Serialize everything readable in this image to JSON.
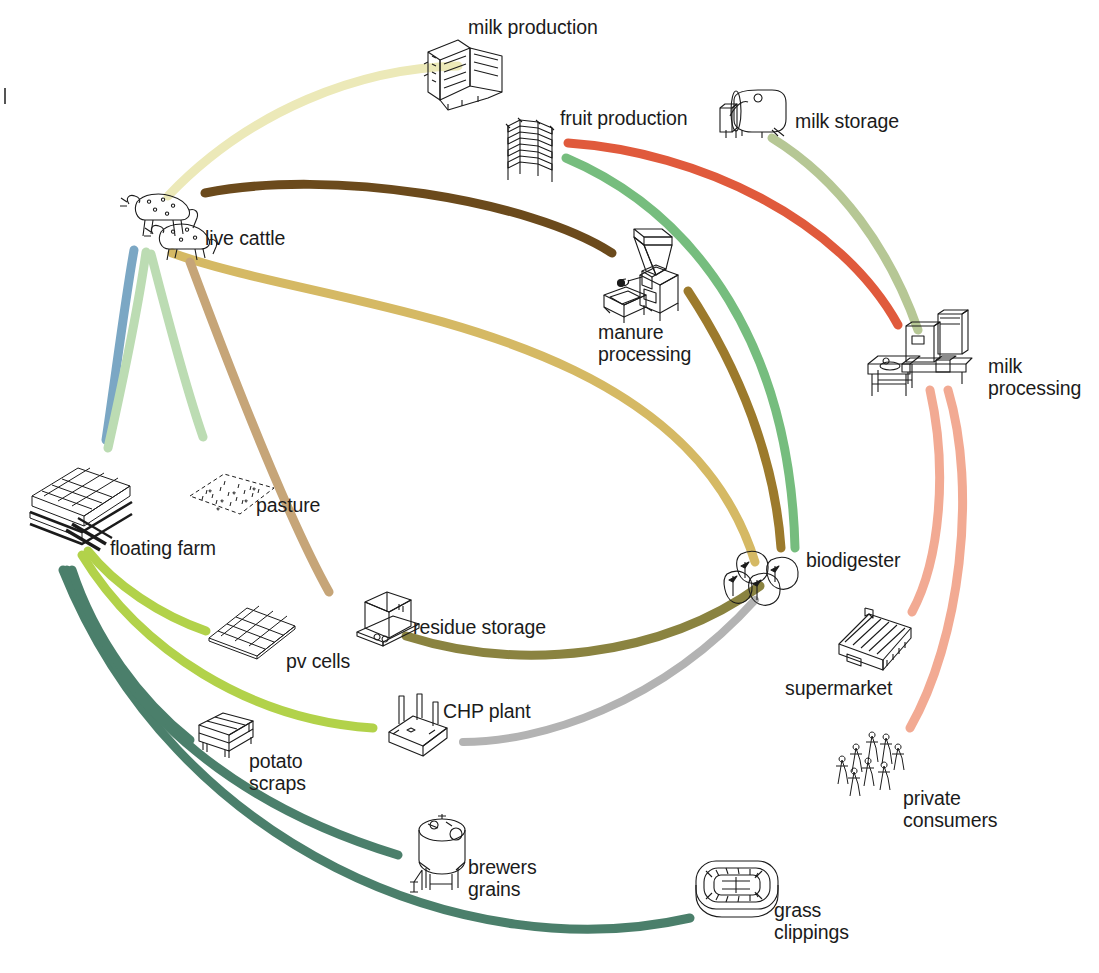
{
  "diagram": {
    "background": "#ffffff"
  },
  "nodes": [
    {
      "id": "milk-production",
      "label": "milk production",
      "label_x": 468,
      "label_y": 16,
      "icon_x": 418,
      "icon_y": 34,
      "icon": "milking-machine-icon"
    },
    {
      "id": "fruit-production",
      "label": "fruit production",
      "label_x": 560,
      "label_y": 107,
      "icon_x": 500,
      "icon_y": 112,
      "icon": "greenhouse-rack-icon"
    },
    {
      "id": "milk-storage",
      "label": "milk storage",
      "label_x": 795,
      "label_y": 110,
      "icon_x": 712,
      "icon_y": 86,
      "icon": "milk-tank-icon"
    },
    {
      "id": "milk-processing",
      "label": "milk\nprocessing",
      "label_x": 988,
      "label_y": 355,
      "icon_x": 866,
      "icon_y": 310,
      "icon": "processing-plant-icon"
    },
    {
      "id": "biodigester",
      "label": "biodigester",
      "label_x": 806,
      "label_y": 549,
      "icon_x": 723,
      "icon_y": 548,
      "icon": "biodigester-tanks-icon"
    },
    {
      "id": "supermarket",
      "label": "supermarket",
      "label_x": 785,
      "label_y": 677,
      "icon_x": 835,
      "icon_y": 604,
      "icon": "supermarket-building-icon"
    },
    {
      "id": "private-consumers",
      "label": "private\nconsumers",
      "label_x": 903,
      "label_y": 787,
      "icon_x": 836,
      "icon_y": 728,
      "icon": "people-crowd-icon"
    },
    {
      "id": "grass-clippings",
      "label": "grass\nclippings",
      "label_x": 774,
      "label_y": 899,
      "icon_x": 692,
      "icon_y": 855,
      "icon": "stadium-icon"
    },
    {
      "id": "brewers-grains",
      "label": "brewers\ngrains",
      "label_x": 468,
      "label_y": 856,
      "icon_x": 408,
      "icon_y": 812,
      "icon": "silo-tank-icon"
    },
    {
      "id": "potato-scraps",
      "label": "potato\nscraps",
      "label_x": 249,
      "label_y": 750,
      "icon_x": 193,
      "icon_y": 709,
      "icon": "crate-icon"
    },
    {
      "id": "chp-plant",
      "label": "CHP plant",
      "label_x": 443,
      "label_y": 700,
      "icon_x": 383,
      "icon_y": 694,
      "icon": "chp-plant-icon"
    },
    {
      "id": "pv-cells",
      "label": "pv cells",
      "label_x": 286,
      "label_y": 650,
      "icon_x": 205,
      "icon_y": 604,
      "icon": "solar-panel-icon"
    },
    {
      "id": "residue-storage",
      "label": "residue storage",
      "label_x": 413,
      "label_y": 616,
      "icon_x": 353,
      "icon_y": 588,
      "icon": "residue-box-icon"
    },
    {
      "id": "pasture",
      "label": "pasture",
      "label_x": 256,
      "label_y": 494,
      "icon_x": 186,
      "icon_y": 470,
      "icon": "pasture-field-icon"
    },
    {
      "id": "floating-farm",
      "label": "floating farm",
      "label_x": 110,
      "label_y": 537,
      "icon_x": 26,
      "icon_y": 466,
      "icon": "floating-farm-icon"
    },
    {
      "id": "live-cattle",
      "label": "live cattle",
      "label_x": 205,
      "label_y": 227,
      "icon_x": 115,
      "icon_y": 188,
      "icon": "cattle-icon"
    },
    {
      "id": "manure-processing",
      "label": "manure\nprocessing",
      "label_x": 598,
      "label_y": 321,
      "icon_x": 600,
      "icon_y": 227,
      "icon": "manure-processor-icon"
    }
  ],
  "flows": [
    {
      "id": "floating-farm-to-milk-production",
      "from": "floating-farm",
      "to": "milk-production",
      "color": "#ece9b8",
      "width": 9,
      "path": "M 168,196 C 250,110 360,68 458,66"
    },
    {
      "id": "milk-storage-to-milk-processing",
      "from": "milk-storage",
      "to": "milk-processing",
      "color": "#b6c795",
      "width": 9,
      "path": "M 772,138 C 840,180 890,250 918,330"
    },
    {
      "id": "fruit-production-to-milk-processing",
      "from": "fruit-production",
      "to": "milk-processing",
      "color": "#e05a3c",
      "width": 9,
      "path": "M 568,143 C 700,152 840,220 898,325"
    },
    {
      "id": "fruit-production-to-biodigester",
      "from": "fruit-production",
      "to": "biodigester",
      "color": "#76bd7e",
      "width": 9,
      "path": "M 566,158 C 700,215 790,350 795,548"
    },
    {
      "id": "live-cattle-to-manure-processing",
      "from": "live-cattle",
      "to": "manure-processing",
      "color": "#6b4a1c",
      "width": 9,
      "path": "M 205,193 C 330,168 530,200 612,253"
    },
    {
      "id": "manure-processing-to-biodigester",
      "from": "manure-processing",
      "to": "biodigester",
      "color": "#9c7a2c",
      "width": 9,
      "path": "M 688,291 C 740,370 775,460 781,548"
    },
    {
      "id": "live-cattle-to-biodigester",
      "from": "live-cattle",
      "to": "biodigester",
      "color": "#d5b964",
      "width": 9,
      "path": "M 172,253 C 330,310 680,320 755,562"
    },
    {
      "id": "biodigester-to-residue-storage",
      "from": "biodigester",
      "to": "residue-storage",
      "color": "#8a8340",
      "width": 9,
      "path": "M 760,586 C 660,658 520,672 406,636"
    },
    {
      "id": "biodigester-to-chp-plant",
      "from": "biodigester",
      "to": "chp-plant",
      "color": "#b3b3b3",
      "width": 8,
      "path": "M 755,600 C 660,705 540,742 463,742"
    },
    {
      "id": "milk-processing-to-supermarket",
      "from": "milk-processing",
      "to": "supermarket",
      "color": "#f2aa93",
      "width": 9,
      "path": "M 930,390 C 948,470 940,560 912,612"
    },
    {
      "id": "milk-processing-to-private-consumers",
      "from": "milk-processing",
      "to": "private-consumers",
      "color": "#f2aa93",
      "width": 9,
      "path": "M 948,390 C 978,490 960,640 910,728"
    },
    {
      "id": "grass-clippings-to-floating-farm",
      "from": "grass-clippings",
      "to": "floating-farm",
      "color": "#4b7f6b",
      "width": 9,
      "path": "M 690,918 C 470,968 175,850 63,570"
    },
    {
      "id": "brewers-grains-to-floating-farm",
      "from": "brewers-grains",
      "to": "floating-farm",
      "color": "#4b7f6b",
      "width": 9,
      "path": "M 398,855 C 250,810 120,720 67,570"
    },
    {
      "id": "potato-scraps-to-floating-farm",
      "from": "potato-scraps",
      "to": "floating-farm",
      "color": "#4b7f6b",
      "width": 9,
      "path": "M 190,740 C 140,700 95,640 72,570"
    },
    {
      "id": "chp-plant-to-floating-farm",
      "from": "chp-plant",
      "to": "floating-farm",
      "color": "#b2d24a",
      "width": 9,
      "path": "M 373,728 C 250,720 140,650 82,555"
    },
    {
      "id": "pv-cells-to-floating-farm",
      "from": "pv-cells",
      "to": "floating-farm",
      "color": "#b2d24a",
      "width": 9,
      "path": "M 206,631 C 160,615 115,585 88,551"
    },
    {
      "id": "floating-farm-to-live-cattle-a",
      "from": "floating-farm",
      "to": "live-cattle",
      "color": "#7ba7c4",
      "width": 9,
      "path": "M 106,440 C 115,380 125,300 134,250"
    },
    {
      "id": "floating-farm-to-live-cattle-b",
      "from": "floating-farm",
      "to": "live-cattle",
      "color": "#bcdcb3",
      "width": 9,
      "path": "M 108,448 C 122,385 138,310 146,252"
    },
    {
      "id": "live-cattle-to-pasture",
      "from": "live-cattle",
      "to": "pasture",
      "color": "#bcdcb3",
      "width": 9,
      "path": "M 151,254 C 168,320 190,400 203,437"
    },
    {
      "id": "pasture-to-live-cattle",
      "from": "pasture",
      "to": "live-cattle",
      "color": "#c6a578",
      "width": 9,
      "path": "M 329,592 C 300,540 260,450 190,262"
    }
  ],
  "edge_mark": {
    "visible": true
  }
}
